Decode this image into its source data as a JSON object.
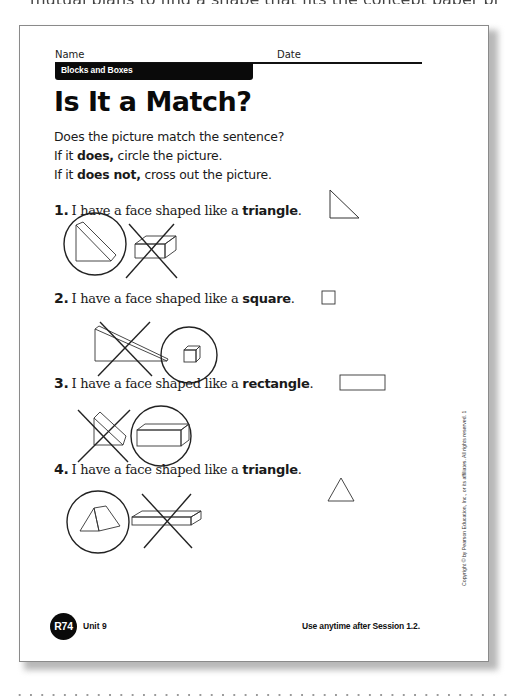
{
  "page_above_fragment": "mutual plans to find a shape that fits the concept paper problem",
  "worksheet": {
    "header": {
      "name_label": "Name",
      "date_label": "Date",
      "unit_title": "Blocks and Boxes"
    },
    "title": "Is It a Match?",
    "instructions": {
      "line1": "Does the picture match the sentence?",
      "line2_prefix": "If it ",
      "line2_bold": "does,",
      "line2_suffix": " circle the picture.",
      "line3_prefix": "If it ",
      "line3_bold": "does not,",
      "line3_suffix": " cross out the picture."
    },
    "questions": [
      {
        "number": "1.",
        "text": "I have a face shaped like a ",
        "shape_word": "triangle",
        "end": ".",
        "reference_shape": "right-triangle",
        "pictures": [
          {
            "object": "triangular-prism-wedge",
            "mark": "circled"
          },
          {
            "object": "rectangular-box",
            "mark": "crossed-out"
          }
        ]
      },
      {
        "number": "2.",
        "text": "I have a face shaped like a ",
        "shape_word": "square",
        "end": ".",
        "reference_shape": "square",
        "pictures": [
          {
            "object": "long-wedge-ramp",
            "mark": "crossed-out"
          },
          {
            "object": "cube",
            "mark": "circled"
          }
        ]
      },
      {
        "number": "3.",
        "text": "I have a face shaped like a ",
        "shape_word": "rectangle",
        "end": ".",
        "reference_shape": "rectangle",
        "pictures": [
          {
            "object": "small-wedge",
            "mark": "crossed-out"
          },
          {
            "object": "long-rectangular-prism",
            "mark": "circled"
          }
        ]
      },
      {
        "number": "4.",
        "text": "I have a face shaped like a ",
        "shape_word": "triangle",
        "end": ".",
        "reference_shape": "equilateral-triangle",
        "pictures": [
          {
            "object": "triangular-prism-tent",
            "mark": "circled"
          },
          {
            "object": "flat-rectangular-slab",
            "mark": "crossed-out"
          }
        ]
      }
    ],
    "copyright": "Copyright © by Pearson Education, Inc., or its affiliates. All rights reserved. 1",
    "footer": {
      "page_badge": "R74",
      "unit": "Unit 9",
      "usage_note": "Use anytime after Session 1.2."
    }
  }
}
